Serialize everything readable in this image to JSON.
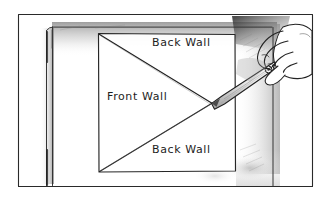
{
  "illustration": {
    "title": "Cutting a diagonal across a wall panel with a utility knife",
    "medium": "pen-and-ink line drawing with graphite shading",
    "background_color": "#ffffff",
    "ink_color": "#1d1d1d",
    "shade_color": "#b9b9b9",
    "labels": {
      "back_wall_top": "Back Wall",
      "front_wall": "Front Wall",
      "back_wall_bottom": "Back Wall"
    },
    "icons": {
      "hand": "hand-icon",
      "knife": "utility-knife-icon",
      "panel": "wall-panel-icon",
      "frame": "picture-frame-icon"
    },
    "scene": {
      "outer_frame": {
        "x": 18,
        "y": 14,
        "width": 295,
        "height": 173
      },
      "panel_rect": {
        "x": 98,
        "y": 33,
        "width": 137,
        "height": 139
      },
      "cut_point": {
        "x": 212,
        "y": 103
      },
      "diagonals": [
        {
          "from": "panel top-left",
          "to": "cut point"
        },
        {
          "from": "panel bottom-left",
          "to": "cut point"
        }
      ]
    }
  }
}
